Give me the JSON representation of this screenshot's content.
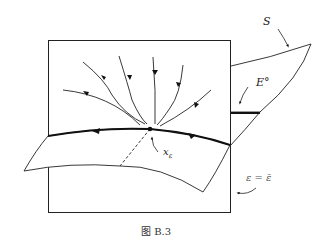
{
  "figure": {
    "caption": "图 B.3",
    "labels": {
      "S": "S",
      "E0": "E°",
      "x_eps": "x",
      "x_eps_sub": "ε",
      "eps_eq": "ε = ε̄"
    }
  }
}
